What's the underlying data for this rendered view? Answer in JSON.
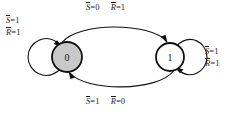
{
  "diagram": {
    "type": "state-transition-diagram",
    "background_color": "#ffffff",
    "stroke_color": "#111111",
    "states": [
      {
        "id": "state-0",
        "label": "0",
        "fill_color": "#c9c9c9",
        "cx": 67,
        "cy": 57,
        "r": 15
      },
      {
        "id": "state-1",
        "label": "1",
        "fill_color": "#ffffff",
        "cx": 170,
        "cy": 57,
        "r": 14
      }
    ],
    "transitions": [
      {
        "id": "t-0-to-1",
        "from": "0",
        "to": "1",
        "position": "top",
        "condition_1": {
          "variable": "S",
          "overline": true,
          "value": "0"
        },
        "condition_2": {
          "variable": "R",
          "overline": true,
          "value": "1"
        }
      },
      {
        "id": "t-1-to-0",
        "from": "1",
        "to": "0",
        "position": "bottom",
        "condition_1": {
          "variable": "S",
          "overline": true,
          "value": "1"
        },
        "condition_2": {
          "variable": "R",
          "overline": true,
          "value": "0"
        }
      },
      {
        "id": "t-0-self",
        "from": "0",
        "to": "0",
        "position": "left",
        "condition_1": {
          "variable": "S",
          "overline": true,
          "value": "1"
        },
        "condition_2": {
          "variable": "R",
          "overline": true,
          "value": "1"
        }
      },
      {
        "id": "t-1-self",
        "from": "1",
        "to": "1",
        "position": "right",
        "condition_1": {
          "variable": "S",
          "overline": true,
          "value": "1"
        },
        "condition_2": {
          "variable": "R",
          "overline": true,
          "value": "1"
        }
      }
    ],
    "symbols": {
      "equals": "=",
      "var_s": "S",
      "var_r": "R"
    }
  }
}
